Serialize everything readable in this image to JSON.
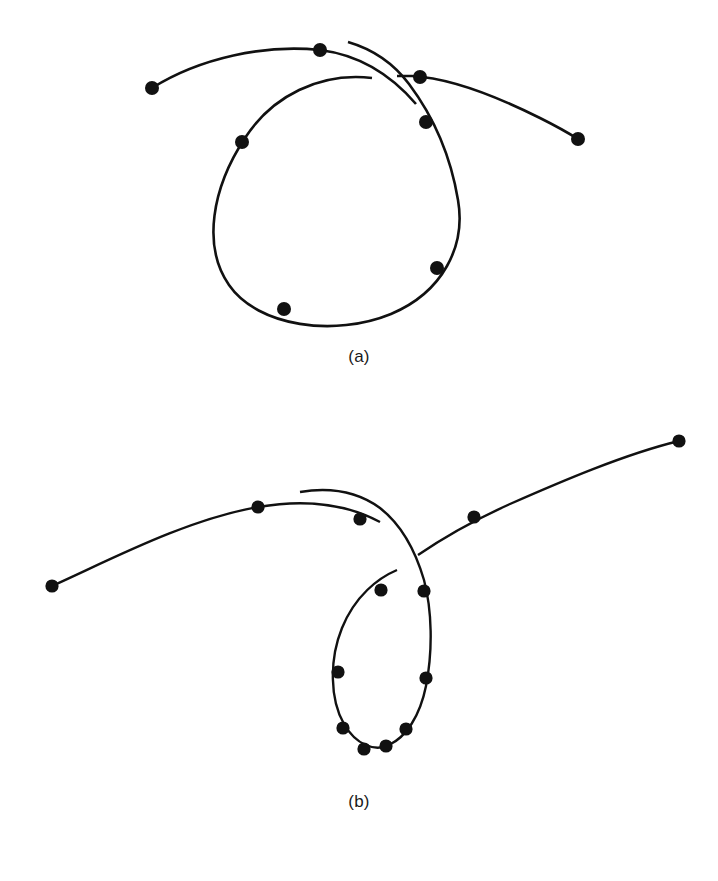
{
  "figure": {
    "background_color": "#ffffff",
    "ink_color": "#111111",
    "width": 718,
    "height": 881,
    "panels": [
      {
        "id": "a",
        "caption": "(a)",
        "description": "Open arc crossing a large teardrop-shaped loop, with sample dots marked along the curves",
        "dot_count": 8,
        "curves": [
          {
            "name": "upper-left-arc",
            "path": "M 152 88 C 200 58, 265 44, 320 50 C 360 55, 392 76, 416 104",
            "stroke_width": 2.6
          },
          {
            "name": "upper-right-arc",
            "path": "M 397 76 L 412 76 C 450 78, 500 98, 540 118 C 558 127, 570 134, 578 139",
            "stroke_width": 2.6
          },
          {
            "name": "teardrop-loop",
            "path": "M 372 78 C 320 72, 272 96, 245 138 C 212 188, 202 246, 229 285 C 258 327, 335 337, 391 314 C 443 292, 466 246, 458 200 C 450 152, 430 112, 409 84 C 394 64, 372 49, 348 42",
            "stroke_width": 2.6
          }
        ],
        "dots": [
          {
            "name": "dot-a-1",
            "x": 152,
            "y": 88,
            "r": 7.0
          },
          {
            "name": "dot-a-2",
            "x": 320,
            "y": 50,
            "r": 7.0
          },
          {
            "name": "dot-a-3",
            "x": 420,
            "y": 77,
            "r": 7.0
          },
          {
            "name": "dot-a-4",
            "x": 578,
            "y": 139,
            "r": 7.0
          },
          {
            "name": "dot-a-5",
            "x": 242,
            "y": 142,
            "r": 7.0
          },
          {
            "name": "dot-a-6",
            "x": 426,
            "y": 122,
            "r": 7.0
          },
          {
            "name": "dot-a-7",
            "x": 437,
            "y": 268,
            "r": 7.0
          },
          {
            "name": "dot-a-8",
            "x": 284,
            "y": 309,
            "r": 7.0
          }
        ]
      },
      {
        "id": "b",
        "caption": "(b)",
        "description": "Long shallow arc crossing a narrow elongated loop, with densely sampled dots along the loop",
        "dot_count": 12,
        "curves": [
          {
            "name": "left-arc",
            "path": "M 52 186 C 110 160, 185 120, 258 107 C 310 98, 350 106, 380 122",
            "stroke_width": 2.4
          },
          {
            "name": "right-arc",
            "path": "M 418 155 C 440 140, 470 122, 510 104 C 560 82, 625 54, 679 41",
            "stroke_width": 2.4
          },
          {
            "name": "elongated-loop",
            "path": "M 397 170 C 378 178, 355 196, 342 228 C 329 260, 330 300, 344 324 C 356 345, 375 352, 389 345 C 406 337, 420 316, 426 286 C 433 250, 432 210, 424 180 C 414 146, 398 122, 380 108 C 358 92, 330 87, 300 92",
            "stroke_width": 2.4
          }
        ],
        "dots": [
          {
            "name": "dot-b-1",
            "x": 52,
            "y": 186,
            "r": 6.6
          },
          {
            "name": "dot-b-2",
            "x": 258,
            "y": 107,
            "r": 6.6
          },
          {
            "name": "dot-b-3",
            "x": 360,
            "y": 119,
            "r": 6.6
          },
          {
            "name": "dot-b-4",
            "x": 474,
            "y": 117,
            "r": 6.6
          },
          {
            "name": "dot-b-5",
            "x": 679,
            "y": 41,
            "r": 6.6
          },
          {
            "name": "dot-b-6",
            "x": 381,
            "y": 190,
            "r": 6.6
          },
          {
            "name": "dot-b-7",
            "x": 424,
            "y": 191,
            "r": 6.6
          },
          {
            "name": "dot-b-8",
            "x": 338,
            "y": 272,
            "r": 6.6
          },
          {
            "name": "dot-b-9",
            "x": 426,
            "y": 278,
            "r": 6.6
          },
          {
            "name": "dot-b-10",
            "x": 343,
            "y": 328,
            "r": 6.6
          },
          {
            "name": "dot-b-11",
            "x": 406,
            "y": 329,
            "r": 6.6
          },
          {
            "name": "dot-b-12",
            "x": 364,
            "y": 349,
            "r": 6.6
          },
          {
            "name": "dot-b-13",
            "x": 386,
            "y": 346,
            "r": 6.6
          }
        ]
      }
    ]
  }
}
